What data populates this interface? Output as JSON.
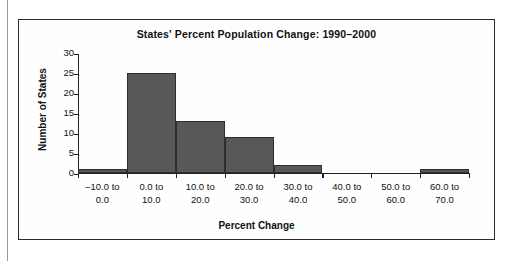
{
  "chart_data": {
    "type": "bar",
    "title": "States' Percent Population Change: 1990–2000",
    "xlabel": "Percent Change",
    "ylabel": "Number of States",
    "categories": [
      "-10.0 to 0.0",
      "0.0 to 10.0",
      "10.0 to 20.0",
      "20.0 to 30.0",
      "30.0 to 40.0",
      "40.0 to 50.0",
      "50.0 to 60.0",
      "60.0 to 70.0"
    ],
    "category_lines": [
      {
        "line1": "–10.0 to",
        "line2": "0.0"
      },
      {
        "line1": "0.0 to",
        "line2": "10.0"
      },
      {
        "line1": "10.0 to",
        "line2": "20.0"
      },
      {
        "line1": "20.0 to",
        "line2": "30.0"
      },
      {
        "line1": "30.0 to",
        "line2": "40.0"
      },
      {
        "line1": "40.0 to",
        "line2": "50.0"
      },
      {
        "line1": "50.0 to",
        "line2": "60.0"
      },
      {
        "line1": "60.0 to",
        "line2": "70.0"
      }
    ],
    "values": [
      1,
      25,
      13,
      9,
      2,
      0,
      0,
      1
    ],
    "ylim": [
      0,
      30
    ],
    "yticks": [
      0,
      5,
      10,
      15,
      20,
      25,
      30
    ],
    "ytick_labels": [
      "0",
      "5",
      "10",
      "15",
      "20",
      "25",
      "30"
    ],
    "xlim": [
      -10.0,
      70.0
    ],
    "bin_width": 10.0,
    "grid": false,
    "legend": false,
    "bar_color": "#58585a",
    "bar_edge_color": "#2e2e30",
    "axis_color": "#222222",
    "text_color": "#111111",
    "background_color": "#fefefe"
  }
}
